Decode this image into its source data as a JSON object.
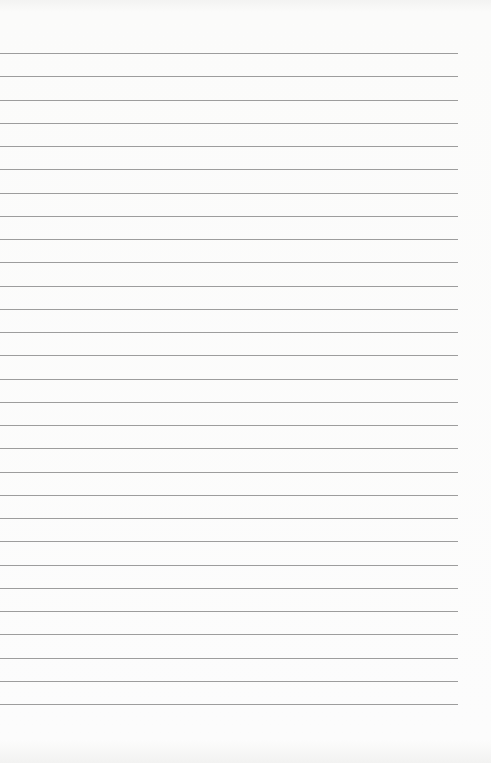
{
  "paper": {
    "type": "lined-paper",
    "background_color": "#fbfbfa",
    "line_color": "#8c8c8c",
    "line_count": 29,
    "first_line_y": 53,
    "line_spacing": 23.25,
    "line_left": 0,
    "line_right": 458,
    "text": ""
  }
}
